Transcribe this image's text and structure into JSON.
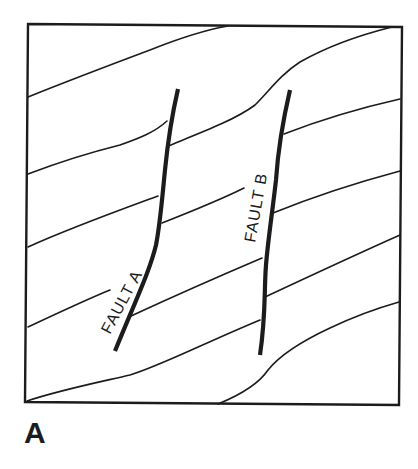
{
  "diagram": {
    "panel_label": "A",
    "faults": [
      {
        "id": "fault-a",
        "label": "FAULT A"
      },
      {
        "id": "fault-b",
        "label": "FAULT B"
      }
    ],
    "colors": {
      "ink": "#1c1c1c",
      "background": "#ffffff"
    }
  }
}
